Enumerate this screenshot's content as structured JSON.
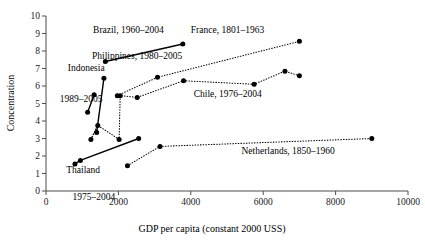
{
  "chart_data": {
    "type": "scatter",
    "title": "",
    "xlabel": "GDP per capita (constant 2000 USS)",
    "ylabel": "Concentration",
    "xlim": [
      0,
      10000
    ],
    "ylim": [
      0,
      10
    ],
    "xticks": [
      0,
      2000,
      4000,
      6000,
      8000,
      10000
    ],
    "xtick_labels": [
      "0",
      "2000",
      "4000",
      "6000",
      "8000",
      "10000"
    ],
    "yticks": [
      0,
      1,
      2,
      3,
      4,
      5,
      6,
      7,
      8,
      9,
      10
    ],
    "ytick_labels": [
      "0",
      "1",
      "2",
      "3",
      "4",
      "5",
      "6",
      "7",
      "8",
      "9",
      "10"
    ],
    "grid": false,
    "legend_position": "inline-annotations",
    "series": [
      {
        "name": "Brazil, 1960-2004",
        "label": "Brazil, 1960–2004",
        "style": "solid",
        "points": [
          [
            1640,
            7.4
          ],
          [
            3780,
            8.4
          ]
        ],
        "label_x": 1300,
        "label_y": 9.05,
        "anchor": "start"
      },
      {
        "name": "France, 1801-1963",
        "label": "France, 1801–1963",
        "style": "dotted",
        "points": [
          [
            1970,
            5.45
          ],
          [
            3080,
            6.5
          ],
          [
            7000,
            8.55
          ]
        ],
        "label_x": 4000,
        "label_y": 9.05,
        "anchor": "start"
      },
      {
        "name": "Philippines, 1980-2005",
        "label": "Philippines, 1980–2005",
        "style": "solid",
        "points": [
          [
            1400,
            3.35
          ],
          [
            1600,
            6.45
          ]
        ],
        "label_x": 1270,
        "label_y": 7.55,
        "anchor": "start"
      },
      {
        "name": "Indonesia, 1989-2005",
        "label": "Indonesia",
        "style": "solid",
        "points": [
          [
            1150,
            4.5
          ],
          [
            1330,
            5.5
          ]
        ],
        "label_x": 600,
        "label_y": 6.85,
        "anchor": "start"
      },
      {
        "name": "Chile, 1976-2004",
        "label": "Chile, 1976–2004",
        "style": "dotted",
        "points": [
          [
            1240,
            2.95
          ],
          [
            1430,
            3.75
          ],
          [
            2020,
            2.95
          ],
          [
            2050,
            5.45
          ],
          [
            2520,
            5.35
          ],
          [
            3800,
            6.3
          ],
          [
            5750,
            6.1
          ],
          [
            6600,
            6.85
          ],
          [
            7000,
            6.58
          ]
        ],
        "label_x": 4080,
        "label_y": 5.4,
        "anchor": "start"
      },
      {
        "name": "Netherlands, 1850-1960",
        "label": "Netherlands, 1850–1960",
        "style": "dotted",
        "points": [
          [
            2250,
            1.45
          ],
          [
            3150,
            2.55
          ],
          [
            9000,
            3.0
          ]
        ],
        "label_x": 5400,
        "label_y": 2.1,
        "anchor": "start"
      },
      {
        "name": "Thailand, 1975-2004",
        "label": "Thailand",
        "style": "solid",
        "points": [
          [
            800,
            1.55
          ],
          [
            950,
            1.75
          ],
          [
            2560,
            3.0
          ]
        ],
        "label_x": 560,
        "label_y": 1.05,
        "anchor": "start"
      }
    ],
    "annotations": [
      {
        "name": "indonesia-years",
        "text": "1989–2005",
        "x": 380,
        "y": 5.08,
        "anchor": "start"
      },
      {
        "name": "thailand-years",
        "text": "1975–2004",
        "x": 730,
        "y": -0.52,
        "anchor": "start"
      }
    ],
    "extra_dotted_segments": [
      {
        "name": "chile-lower-left-stub",
        "points": [
          [
            1240,
            2.95
          ],
          [
            1430,
            3.75
          ]
        ]
      }
    ]
  }
}
